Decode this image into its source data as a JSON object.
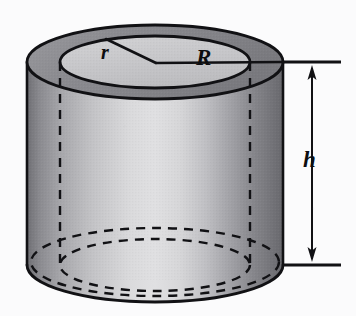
{
  "figure": {
    "kind": "geometry-diagram",
    "background_color": "#fbfbfc",
    "ink_color": "#111114"
  },
  "labels": {
    "inner_radius": "r",
    "outer_radius": "R",
    "height": "h"
  },
  "geometry": {
    "top_face": {
      "center_x": 155,
      "center_y": 62,
      "outer_rx": 128,
      "outer_ry": 37,
      "inner_rx": 95,
      "inner_ry": 26
    },
    "bottom_face": {
      "center_x": 155,
      "center_y": 265,
      "outer_rx": 128,
      "outer_ry": 37,
      "inner_rx": 95,
      "inner_ry": 26
    },
    "body_height_px": 203,
    "hidden_edge_x_left": 60,
    "hidden_edge_x_right": 250
  },
  "dimension": {
    "arrow_x": 312,
    "top_y": 62,
    "bottom_y": 265,
    "extension_line_left_x": 283,
    "extension_line_right_x": 341,
    "style": "double-headed-arrow"
  },
  "leaders": {
    "r_leader": {
      "from_x": 156,
      "from_y": 63,
      "to_x": 106,
      "to_y": 39
    },
    "R_leader": {
      "from_x": 156,
      "from_y": 63,
      "to_x": 283,
      "to_y": 62
    }
  },
  "shading": {
    "annulus_ring": "#8f8f93",
    "inner_top_face": "#c9c9cb",
    "body_light": "#dcdcde",
    "body_mid": "#b0b0b4",
    "body_dark": "#77777c",
    "bottom_inside": "#cfcfd1"
  }
}
